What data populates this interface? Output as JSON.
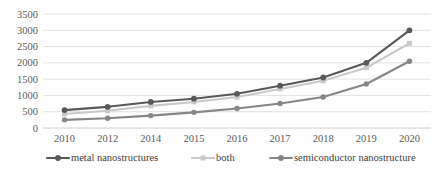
{
  "chart_data": {
    "type": "line",
    "title": "",
    "subtitle": "",
    "xlabel": "",
    "ylabel": "",
    "categories": [
      "2010",
      "2012",
      "2014",
      "2015",
      "2016",
      "2017",
      "2018",
      "2019",
      "2020"
    ],
    "x": [
      "2010",
      "2012",
      "2014",
      "2015",
      "2016",
      "2017",
      "2018",
      "2019",
      "2020"
    ],
    "ylim": [
      0,
      3500
    ],
    "yticks": [
      0,
      500,
      1000,
      1500,
      2000,
      2500,
      3000,
      3500
    ],
    "ytick_labels": [
      "0",
      "500",
      "1000",
      "1500",
      "2000",
      "2500",
      "3000",
      "3500"
    ],
    "grid": true,
    "grid_axis": "y",
    "legend_position": "bottom",
    "series": [
      {
        "name": "metal nanostructures",
        "color": "#595959",
        "marker": "circle",
        "values": [
          550,
          650,
          800,
          900,
          1050,
          1300,
          1550,
          2000,
          3000
        ]
      },
      {
        "name": "both",
        "color": "#c9c9c9",
        "marker": "square",
        "values": [
          430,
          530,
          680,
          800,
          950,
          1200,
          1450,
          1850,
          2600
        ]
      },
      {
        "name": "semiconductor nanostructure",
        "color": "#868686",
        "marker": "diamond",
        "values": [
          250,
          300,
          380,
          480,
          600,
          750,
          950,
          1350,
          2050
        ]
      }
    ]
  },
  "legend": {
    "items": [
      {
        "label": "metal nanostructures",
        "color": "#595959"
      },
      {
        "label": "both",
        "color": "#c9c9c9"
      },
      {
        "label": "semiconductor nanostructure",
        "color": "#868686"
      }
    ]
  },
  "axes": {
    "y_axis_name": "value-axis",
    "x_axis_name": "category-axis"
  }
}
